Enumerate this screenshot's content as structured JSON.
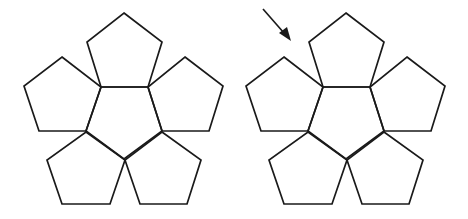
{
  "diagram": {
    "colors": {
      "stroke": "#1a1a1a",
      "background": "#ffffff"
    },
    "figures": [
      {
        "id": "net-left",
        "pentagon_count": 6,
        "has_arrow": false
      },
      {
        "id": "net-right",
        "pentagon_count": 6,
        "has_arrow": true,
        "arrow_target": "gap between top pentagon and upper-left pentagon"
      }
    ],
    "pentagon_roles": [
      "center",
      "top",
      "upper-left",
      "upper-right",
      "lower-left",
      "lower-right"
    ]
  }
}
